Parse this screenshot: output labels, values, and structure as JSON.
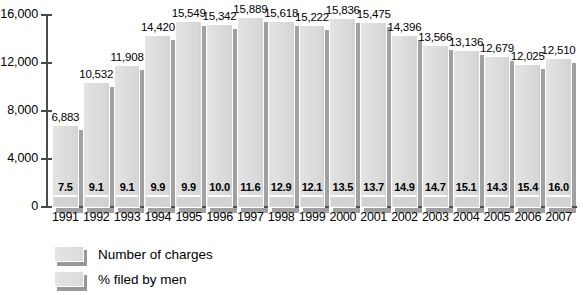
{
  "chart_data": {
    "type": "bar",
    "title": "",
    "subtitle": "",
    "xlabel": "",
    "ylabel": "",
    "categories": [
      "1991",
      "1992",
      "1993",
      "1994",
      "1995",
      "1996",
      "1997",
      "1998",
      "1999",
      "2000",
      "2001",
      "2002",
      "2003",
      "2004",
      "2005",
      "2006",
      "2007"
    ],
    "ylim": [
      0,
      16000
    ],
    "yticks": [
      0,
      4000,
      8000,
      12000,
      16000
    ],
    "ytick_labels": [
      "0",
      "4,000",
      "8,000",
      "12,000",
      "16,000"
    ],
    "grid": false,
    "legend_position": "bottom-left",
    "series": [
      {
        "name": "Number of charges",
        "values": [
          6883,
          10532,
          11908,
          14420,
          15549,
          15342,
          15889,
          15618,
          15222,
          15836,
          15475,
          14396,
          13566,
          13136,
          12679,
          12025,
          12510
        ],
        "labels": [
          "6,883",
          "10,532",
          "11,908",
          "14,420",
          "15,549",
          "15,342",
          "15,889",
          "15,618",
          "15,222",
          "15,836",
          "15,475",
          "14,396",
          "13,566",
          "13,136",
          "12,679",
          "12,025",
          "12,510"
        ],
        "color": "#d6d6d6"
      },
      {
        "name": "% filed by men",
        "values": [
          7.5,
          9.1,
          9.1,
          9.9,
          9.9,
          10.0,
          11.6,
          12.9,
          12.1,
          13.5,
          13.7,
          14.9,
          14.7,
          15.1,
          14.3,
          15.4,
          16.0
        ],
        "labels": [
          "7.5",
          "9.1",
          "9.1",
          "9.9",
          "9.9",
          "10.0",
          "11.6",
          "12.9",
          "12.1",
          "13.5",
          "13.7",
          "14.9",
          "14.7",
          "15.1",
          "14.3",
          "15.4",
          "16.0"
        ],
        "color": "#d2d2d2"
      }
    ]
  },
  "legend": {
    "items": [
      {
        "label": "Number of charges"
      },
      {
        "label": "% filed by men"
      }
    ]
  },
  "colors": {
    "bar_fill": "#d6d6d6",
    "bar_shadow": "#555555",
    "axis": "#4a4a4a",
    "text": "#000000",
    "background": "#ffffff"
  }
}
